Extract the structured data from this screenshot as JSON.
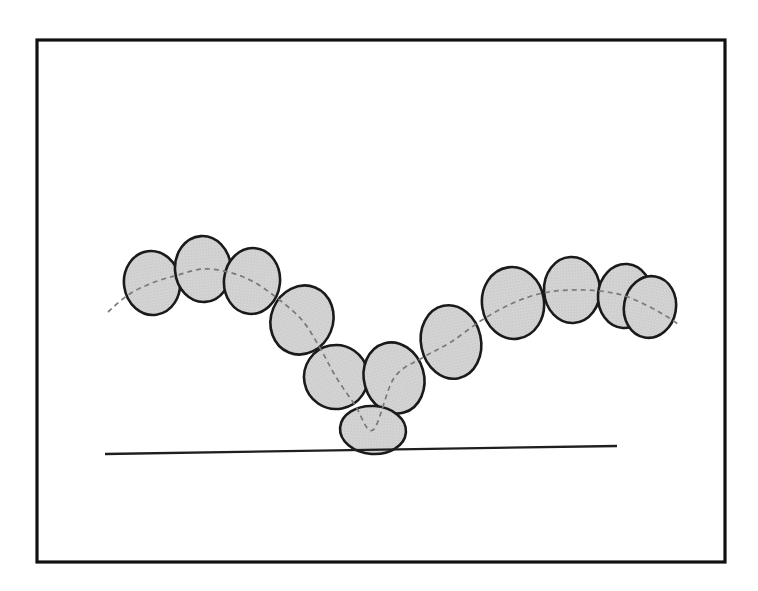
{
  "figure": {
    "caption": "",
    "background_color": "#ffffff"
  },
  "frame": {
    "name": "outer-border",
    "x": 37,
    "y": 40,
    "width": 688,
    "height": 522,
    "stroke_color": "#111111",
    "stroke_width": 3.2,
    "fill": "none"
  },
  "style": {
    "ellipse_fill": "#d4d4d4",
    "ellipse_stroke": "#1a1a1a",
    "ellipse_stroke_width": 2.6,
    "dashed_path_color": "#7a7a7a",
    "dashed_path_width": 1.7,
    "dash_pattern": "5,4",
    "ground_line_color": "#1f1f1f",
    "ground_line_width": 2.3
  },
  "ground_line": {
    "name": "ground-line",
    "x1": 105,
    "y1": 454,
    "x2": 617,
    "y2": 446
  },
  "chart_data": {
    "type": "scatter",
    "xlabel": "",
    "ylabel": "",
    "xlim": [
      37,
      725
    ],
    "ylim": [
      40,
      562
    ],
    "grid": false,
    "legend": null,
    "ellipse_count": 12,
    "ellipses": [
      {
        "id": 1,
        "label": "ellipse-1",
        "cx": 152,
        "cy": 283,
        "rx": 28,
        "ry": 32,
        "rotation": -8
      },
      {
        "id": 2,
        "label": "ellipse-2",
        "cx": 203,
        "cy": 269,
        "rx": 28,
        "ry": 33,
        "rotation": -4
      },
      {
        "id": 3,
        "label": "ellipse-3",
        "cx": 252,
        "cy": 281,
        "rx": 28,
        "ry": 33,
        "rotation": 6
      },
      {
        "id": 4,
        "label": "ellipse-4",
        "cx": 302,
        "cy": 320,
        "rx": 31,
        "ry": 35,
        "rotation": 22
      },
      {
        "id": 5,
        "label": "ellipse-5",
        "cx": 336,
        "cy": 377,
        "rx": 32,
        "ry": 32,
        "rotation": 34
      },
      {
        "id": 6,
        "label": "ellipse-6",
        "cx": 394,
        "cy": 378,
        "rx": 30,
        "ry": 36,
        "rotation": -16
      },
      {
        "id": 7,
        "label": "ellipse-7",
        "cx": 373,
        "cy": 430,
        "rx": 33,
        "ry": 24,
        "rotation": 4
      },
      {
        "id": 8,
        "label": "ellipse-8",
        "cx": 451,
        "cy": 342,
        "rx": 30,
        "ry": 37,
        "rotation": -12
      },
      {
        "id": 9,
        "label": "ellipse-9",
        "cx": 513,
        "cy": 303,
        "rx": 31,
        "ry": 36,
        "rotation": -8
      },
      {
        "id": 10,
        "label": "ellipse-10",
        "cx": 572,
        "cy": 290,
        "rx": 28,
        "ry": 33,
        "rotation": -3
      },
      {
        "id": 11,
        "label": "ellipse-11",
        "cx": 625,
        "cy": 296,
        "rx": 27,
        "ry": 32,
        "rotation": 4
      },
      {
        "id": 12,
        "label": "ellipse-12",
        "cx": 650,
        "cy": 307,
        "rx": 26,
        "ry": 31,
        "rotation": 10
      }
    ],
    "dashed_path_points": [
      [
        108,
        312
      ],
      [
        128,
        295
      ],
      [
        152,
        283
      ],
      [
        178,
        275
      ],
      [
        203,
        269
      ],
      [
        228,
        272
      ],
      [
        252,
        281
      ],
      [
        277,
        298
      ],
      [
        302,
        320
      ],
      [
        320,
        348
      ],
      [
        336,
        377
      ],
      [
        355,
        405
      ],
      [
        373,
        430
      ],
      [
        394,
        378
      ],
      [
        422,
        358
      ],
      [
        451,
        342
      ],
      [
        482,
        320
      ],
      [
        513,
        303
      ],
      [
        543,
        293
      ],
      [
        572,
        290
      ],
      [
        600,
        291
      ],
      [
        625,
        296
      ],
      [
        650,
        307
      ],
      [
        666,
        316
      ],
      [
        678,
        324
      ]
    ],
    "left_tail": {
      "x1": 108,
      "y1": 312,
      "x2": 128,
      "y2": 295
    },
    "right_tail": {
      "x1": 650,
      "y1": 307,
      "x2": 678,
      "y2": 324
    }
  }
}
